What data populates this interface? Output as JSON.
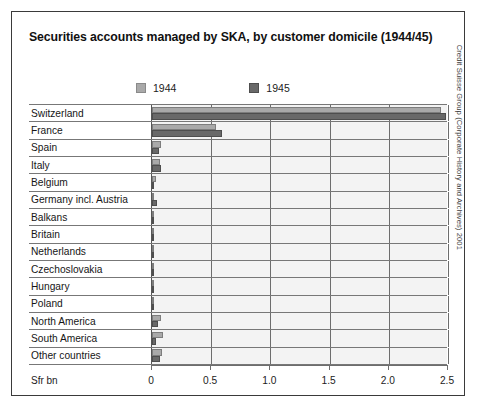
{
  "figure": {
    "title": "Securities accounts managed by SKA, by customer domicile (1944/45)",
    "credit": "Credit Suisse Group (Corporate History and Archives) 2001",
    "axis_unit": "Sfr bn",
    "colors": {
      "series_1944": "#a9a9a9",
      "series_1945": "#696969",
      "plot_background": "#f3f3f3",
      "frame": "#3a3a3a",
      "gridline": "#6d6d6d"
    }
  },
  "chart_data": {
    "type": "bar",
    "title": "Securities accounts managed by SKA, by customer domicile (1944/45)",
    "xlabel": "Sfr bn",
    "ylabel": "",
    "orientation": "horizontal",
    "xlim": [
      0,
      2.5
    ],
    "grid": true,
    "legend_position": "top",
    "tick_labels": [
      "0",
      "0.5",
      "1.0",
      "1.5",
      "2.0",
      "2.5"
    ],
    "tick_values": [
      0,
      0.5,
      1.0,
      1.5,
      2.0,
      2.5
    ],
    "categories": [
      "Switzerland",
      "France",
      "Spain",
      "Italy",
      "Belgium",
      "Germany incl. Austria",
      "Balkans",
      "Britain",
      "Netherlands",
      "Czechoslovakia",
      "Hungary",
      "Poland",
      "North America",
      "South America",
      "Other countries"
    ],
    "series": [
      {
        "name": "1944",
        "color": "#a9a9a9",
        "values": [
          2.44,
          0.54,
          0.08,
          0.07,
          0.03,
          0.02,
          0.015,
          0.015,
          0.015,
          0.004,
          0.006,
          0.004,
          0.075,
          0.095,
          0.085
        ]
      },
      {
        "name": "1945",
        "color": "#696969",
        "values": [
          2.48,
          0.59,
          0.055,
          0.08,
          0.015,
          0.045,
          0.02,
          0.02,
          0.02,
          0.004,
          0.004,
          0.004,
          0.05,
          0.035,
          0.07
        ]
      }
    ]
  }
}
